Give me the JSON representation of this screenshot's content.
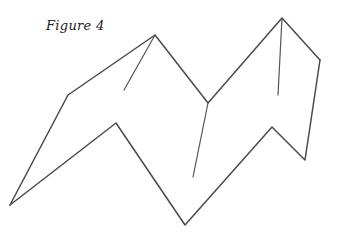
{
  "caption": "Figure 4",
  "colors": {
    "line": "#4a4a4a",
    "background": "#ffffff"
  },
  "shape": {
    "description": "Hand-drawn folded zig-zag paper (M-shape)",
    "vertices": {
      "A_top_peak": [
        155,
        35
      ],
      "B_left_upper": [
        68,
        95
      ],
      "C_left_bottom": [
        10,
        205
      ],
      "D_inner_left": [
        116,
        123
      ],
      "E_bottom_valley": [
        185,
        225
      ],
      "F_mid_valley": [
        208,
        103
      ],
      "G_right_peak": [
        282,
        18
      ],
      "H_right_shoulder": [
        320,
        60
      ],
      "I_right_lower": [
        305,
        160
      ],
      "J_inner_right": [
        272,
        127
      ]
    },
    "creases": [
      {
        "from": [
          155,
          35
        ],
        "to": [
          124,
          90
        ]
      },
      {
        "from": [
          208,
          103
        ],
        "to": [
          193,
          177
        ]
      },
      {
        "from": [
          282,
          18
        ],
        "to": [
          278,
          95
        ]
      }
    ]
  }
}
